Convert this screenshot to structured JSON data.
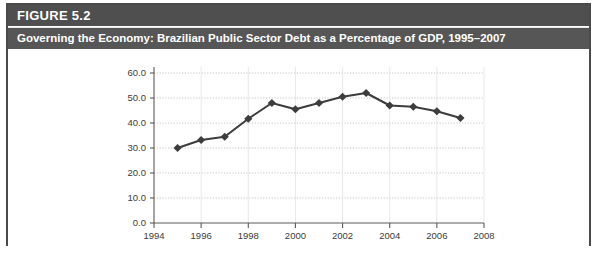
{
  "figure": {
    "number_label": "FIGURE 5.2",
    "title": "Governing the Economy: Brazilian Public Sector Debt as a Percentage of GDP, 1995–2007"
  },
  "chart_data": {
    "type": "line",
    "title": "Governing the Economy: Brazilian Public Sector Debt as a Percentage of GDP, 1995–2007",
    "xlabel": "",
    "ylabel": "",
    "x": [
      1995,
      1996,
      1997,
      1998,
      1999,
      2000,
      2001,
      2002,
      2003,
      2004,
      2005,
      2006,
      2007
    ],
    "values": [
      30.0,
      33.2,
      34.5,
      41.7,
      48.0,
      45.5,
      48.0,
      50.5,
      52.0,
      47.0,
      46.5,
      44.7,
      42.0
    ],
    "series": [
      {
        "name": "Public Sector Debt (% of GDP)",
        "values": [
          30.0,
          33.2,
          34.5,
          41.7,
          48.0,
          45.5,
          48.0,
          50.5,
          52.0,
          47.0,
          46.5,
          44.7,
          42.0
        ]
      }
    ],
    "xlim": [
      1994,
      2008
    ],
    "ylim": [
      0.0,
      60.0
    ],
    "x_tick_labels": [
      "1994",
      "1996",
      "1998",
      "2000",
      "2002",
      "2004",
      "2006",
      "2008"
    ],
    "x_tick_values": [
      1994,
      1996,
      1998,
      2000,
      2002,
      2004,
      2006,
      2008
    ],
    "y_tick_labels": [
      "60.0",
      "50.0",
      "40.0",
      "30.0",
      "20.0",
      "10.0",
      "0.0"
    ],
    "y_tick_values": [
      60.0,
      50.0,
      40.0,
      30.0,
      20.0,
      10.0,
      0.0
    ],
    "grid": true,
    "legend": "none",
    "marker": "diamond",
    "line_color": "#3d3d3d",
    "grid_color": "#b8b8b8",
    "axis_color": "#5a5a5a"
  },
  "colors": {
    "header_bar": "#4f4f4f",
    "title_bar": "#565656",
    "frame_border": "#4a4a4a",
    "background": "#ffffff",
    "text_on_dark": "#ffffff",
    "tick_text": "#3b3b3b"
  }
}
